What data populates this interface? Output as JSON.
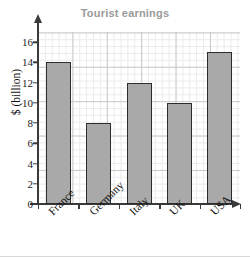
{
  "chart_data": {
    "type": "bar",
    "title": "Tourist earnings",
    "xlabel": "",
    "ylabel": "$ (billion)",
    "categories": [
      "France",
      "Germany",
      "Italy",
      "UK",
      "USA"
    ],
    "values": [
      14,
      8,
      12,
      10,
      15
    ],
    "ylim": [
      0,
      17
    ],
    "ytick_labels": [
      "0",
      "2",
      "4",
      "6",
      "8",
      "10",
      "12",
      "14",
      "16"
    ],
    "ytick_values": [
      0,
      2,
      4,
      6,
      8,
      10,
      12,
      14,
      16
    ],
    "grid": true,
    "legend": null,
    "colors": {
      "bar_fill": "#a9a9a9",
      "bar_stroke": "#2c2c2c",
      "title": "#9a9a9a",
      "axis": "#3a3a3a",
      "grid_major": "#c9c9c9",
      "grid_minor": "#eceaea",
      "background": "#ffffff"
    }
  }
}
